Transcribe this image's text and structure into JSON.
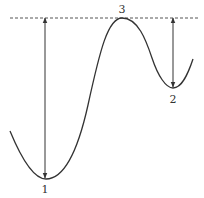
{
  "diagram": {
    "type": "curve-with-reference-line",
    "colors": {
      "curve": "#333333",
      "arrows": "#333333",
      "reference_line": "#555555",
      "background": "#ffffff"
    },
    "reference_line": {
      "y": 18,
      "x1": 10,
      "x2": 200,
      "style": "dashed"
    },
    "curve_path": "M 10 131 C 22 160, 34 179, 46 179 C 64 179, 78 150, 88 105 C 100 50, 108 18, 122 18 C 138 18, 146 40, 152 58 C 158 76, 166 88, 173 88 C 182 88, 188 74, 193 59",
    "points": [
      {
        "id": "1",
        "label": "1",
        "x": 46,
        "y": 179,
        "label_x": 45,
        "label_y": 189
      },
      {
        "id": "2",
        "label": "2",
        "x": 173,
        "y": 88,
        "label_x": 173,
        "label_y": 99
      },
      {
        "id": "3",
        "label": "3",
        "x": 122,
        "y": 18,
        "label_x": 122,
        "label_y": 9
      }
    ],
    "arrows": [
      {
        "id": "arrow-1",
        "x": 45,
        "y1": 18,
        "y2": 178
      },
      {
        "id": "arrow-2",
        "x": 173,
        "y1": 18,
        "y2": 87
      }
    ]
  }
}
